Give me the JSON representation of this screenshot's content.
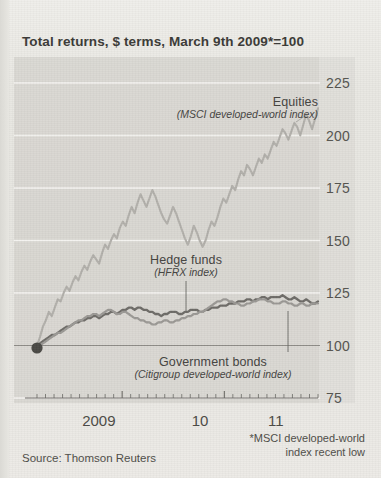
{
  "title": "Total returns, $ terms, March 9th 2009*=100",
  "source": "Source: Thomson Reuters",
  "footnote_line1": "*MSCI developed-world",
  "footnote_line2": "index recent low",
  "labels": {
    "equities_name": "Equities",
    "equities_sub": "(MSCI developed-world index)",
    "hedge_name": "Hedge funds",
    "hedge_sub": "(HFRX index)",
    "bonds_name": "Government bonds",
    "bonds_sub": "(Citigroup developed-world index)"
  },
  "colors": {
    "background": "#e9e8e4",
    "panel": "#d6d5d0",
    "equities": "#b2b0ab",
    "hedge_funds": "#6e6c68",
    "gov_bonds": "#9b9995",
    "gridline": "#f4f3f0",
    "axis": "#6a6964",
    "text": "#44433f",
    "marker": "#4a4945"
  },
  "chart_data": {
    "type": "line",
    "title": "Total returns, $ terms, March 9th 2009*=100",
    "xlabel": "",
    "ylabel": "",
    "ylim": [
      75,
      225
    ],
    "yticks": [
      75,
      100,
      125,
      150,
      175,
      200,
      225
    ],
    "xticks": [
      "2009",
      "10",
      "11"
    ],
    "xtick_positions": [
      0.22,
      0.58,
      0.85
    ],
    "xlim_note": "March 2009 to late 2011, monthly ticks",
    "grid": "horizontal gridlines at each ytick",
    "legend": "inline annotations with leader lines",
    "baseline_marker": {
      "x": 0.0,
      "y": 100,
      "style": "filled circle"
    },
    "series": [
      {
        "name": "Equities",
        "sublabel": "(MSCI developed-world index)",
        "color": "#b2b0ab",
        "values": [
          100,
          104,
          109,
          112,
          116,
          114,
          118,
          122,
          121,
          125,
          128,
          126,
          130,
          133,
          131,
          135,
          138,
          136,
          140,
          143,
          141,
          139,
          144,
          148,
          146,
          150,
          153,
          151,
          156,
          159,
          157,
          162,
          166,
          163,
          168,
          172,
          169,
          166,
          170,
          174,
          171,
          167,
          163,
          160,
          158,
          162,
          166,
          163,
          159,
          155,
          151,
          148,
          152,
          157,
          154,
          150,
          147,
          150,
          155,
          159,
          157,
          161,
          166,
          170,
          168,
          172,
          176,
          174,
          179,
          183,
          181,
          186,
          184,
          181,
          185,
          189,
          187,
          191,
          189,
          193,
          197,
          195,
          199,
          203,
          201,
          198,
          202,
          206,
          204,
          200,
          205,
          210,
          207,
          203,
          208,
          213
        ],
        "end_value": 213
      },
      {
        "name": "Hedge funds",
        "sublabel": "(HFRX index)",
        "color": "#6e6c68",
        "values": [
          100,
          101,
          102,
          103,
          104,
          105,
          105,
          106,
          107,
          108,
          109,
          109,
          110,
          111,
          111,
          112,
          112,
          113,
          113,
          114,
          114,
          113,
          114,
          115,
          115,
          116,
          116,
          115,
          116,
          117,
          117,
          118,
          118,
          117,
          118,
          118,
          117,
          117,
          116,
          116,
          115,
          115,
          114,
          115,
          115,
          116,
          116,
          116,
          115,
          115,
          116,
          116,
          117,
          117,
          117,
          116,
          116,
          117,
          117,
          118,
          118,
          118,
          119,
          119,
          119,
          120,
          120,
          120,
          121,
          121,
          121,
          122,
          122,
          121,
          122,
          122,
          123,
          123,
          122,
          123,
          123,
          123,
          123,
          124,
          123,
          122,
          122,
          123,
          122,
          121,
          121,
          122,
          121,
          120,
          120,
          121
        ],
        "end_value": 121
      },
      {
        "name": "Government bonds",
        "sublabel": "(Citigroup developed-world index)",
        "color": "#9b9995",
        "values": [
          100,
          100,
          101,
          102,
          103,
          104,
          105,
          106,
          106,
          107,
          108,
          109,
          110,
          111,
          112,
          112,
          113,
          114,
          114,
          115,
          115,
          114,
          115,
          116,
          117,
          117,
          116,
          115,
          115,
          116,
          116,
          115,
          114,
          113,
          113,
          112,
          112,
          111,
          111,
          110,
          110,
          111,
          111,
          112,
          112,
          111,
          111,
          112,
          112,
          113,
          113,
          114,
          114,
          115,
          115,
          116,
          116,
          117,
          118,
          119,
          120,
          121,
          121,
          122,
          122,
          121,
          121,
          120,
          120,
          119,
          119,
          120,
          120,
          121,
          121,
          122,
          122,
          122,
          121,
          121,
          120,
          120,
          120,
          121,
          121,
          120,
          120,
          119,
          119,
          120,
          120,
          119,
          119,
          120,
          120,
          120
        ],
        "end_value": 120
      }
    ]
  }
}
